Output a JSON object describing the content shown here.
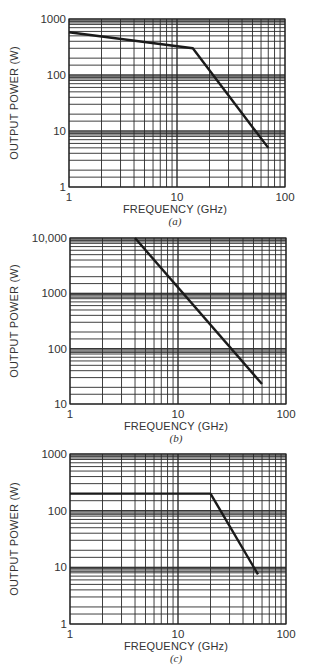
{
  "figure": {
    "panels": [
      "a",
      "b",
      "c"
    ]
  },
  "chart_data": [
    {
      "type": "line",
      "panel_label": "(a)",
      "title": "",
      "xlabel": "FREQUENCY (GHz)",
      "ylabel": "OUTPUT POWER (W)",
      "xscale": "log",
      "yscale": "log",
      "xlim": [
        1,
        100
      ],
      "ylim": [
        1,
        1000
      ],
      "x_ticks": [
        "1",
        "10",
        "100"
      ],
      "y_ticks": [
        "1",
        "10",
        "100",
        "1000"
      ],
      "grid": true,
      "series": [
        {
          "name": "output power",
          "x": [
            1,
            14,
            70
          ],
          "y": [
            580,
            300,
            5
          ]
        }
      ],
      "layout": {
        "left": 69,
        "top": 19,
        "right": 285,
        "bottom": 187
      }
    },
    {
      "type": "line",
      "panel_label": "(b)",
      "title": "",
      "xlabel": "FREQUENCY (GHz)",
      "ylabel": "OUTPUT POWER (W)",
      "xscale": "log",
      "yscale": "log",
      "xlim": [
        1,
        100
      ],
      "ylim": [
        10,
        10000
      ],
      "x_ticks": [
        "1",
        "10",
        "100"
      ],
      "y_ticks": [
        "10",
        "100",
        "1000",
        "10,000"
      ],
      "grid": true,
      "series": [
        {
          "name": "output power",
          "x": [
            4,
            60
          ],
          "y": [
            10000,
            23
          ]
        }
      ],
      "layout": {
        "left": 70,
        "top": 238,
        "right": 286,
        "bottom": 404
      }
    },
    {
      "type": "line",
      "panel_label": "(c)",
      "title": "",
      "xlabel": "FREQUENCY (GHz)",
      "ylabel": "OUTPUT POWER (W)",
      "xscale": "log",
      "yscale": "log",
      "xlim": [
        1,
        100
      ],
      "ylim": [
        1,
        1000
      ],
      "x_ticks": [
        "1",
        "10",
        "100"
      ],
      "y_ticks": [
        "1",
        "10",
        "100",
        "1000"
      ],
      "grid": true,
      "series": [
        {
          "name": "output power",
          "x": [
            1,
            20,
            55
          ],
          "y": [
            200,
            200,
            7.5
          ]
        }
      ],
      "layout": {
        "left": 70,
        "top": 454,
        "right": 286,
        "bottom": 624
      }
    }
  ]
}
